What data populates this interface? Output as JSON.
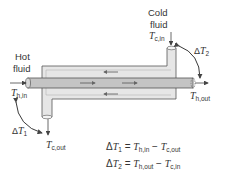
{
  "diagram": {
    "labels": {
      "hot_fluid_line1": "Hot",
      "hot_fluid_line2": "fluid",
      "cold_fluid_line1": "Cold",
      "cold_fluid_line2": "fluid",
      "T": "T",
      "h_in": "h,in",
      "h_out": "h,out",
      "c_in": "c,in",
      "c_out": "c,out",
      "delta": "Δ",
      "sub1": "1",
      "sub2": "2"
    },
    "equations": [
      {
        "lhs_sub": "1",
        "rhs1_sub": "h,in",
        "rhs2_sub": "c,out",
        "equals": " = ",
        "minus": " − "
      },
      {
        "lhs_sub": "2",
        "rhs1_sub": "h,out",
        "rhs2_sub": "c,in",
        "equals": " = ",
        "minus": " − "
      }
    ],
    "flows": {
      "hot": "left-to-right (inner tube)",
      "cold": "right-to-left (annulus)"
    },
    "colors": {
      "shell_fill": "#e6e6e6",
      "tube_fill": "#c4c4c4",
      "stroke": "#555555",
      "text": "#333333"
    }
  }
}
